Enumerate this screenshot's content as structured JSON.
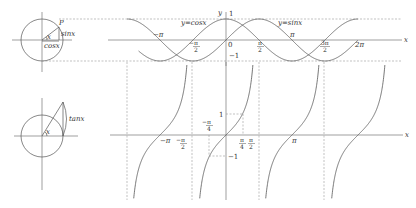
{
  "figure": {
    "title": "",
    "colors": {
      "background": "#ffffff",
      "curve": "#555555",
      "axis": "#777777",
      "dashed": "#999999",
      "text": "#333333"
    }
  },
  "unit_circle_sin": {
    "point_label": "P",
    "angle_label": "x",
    "sin_label": "sinx",
    "cos_label": "cosx"
  },
  "unit_circle_tan": {
    "angle_label": "x",
    "tan_label": "tanx"
  },
  "sin_cos_graph": {
    "axis_x_label": "x",
    "axis_y_label": "y",
    "cos_label": "y=cosx",
    "sin_label": "y=sinx",
    "tick_one": "1",
    "tick_neg_one": "−1",
    "origin": "0",
    "ticks": {
      "neg_pi": "−π",
      "neg_half_pi_num": "π",
      "neg_half_pi_den": "2",
      "half_pi_num": "π",
      "half_pi_den": "2",
      "pi": "π",
      "three_half_pi_num": "3π",
      "three_half_pi_den": "2",
      "two_pi": "2π"
    }
  },
  "tan_graph": {
    "axis_x_label": "x",
    "tick_one": "1",
    "tick_neg_one": "−1",
    "ticks": {
      "neg_pi": "−π",
      "neg_half_pi_num": "π",
      "neg_half_pi_den": "2",
      "neg_quarter_pi_num": "π",
      "neg_quarter_pi_den": "4",
      "quarter_pi_num": "π",
      "quarter_pi_den": "4",
      "half_pi_num": "π",
      "half_pi_den": "2",
      "pi": "π"
    }
  },
  "chart_data": [
    {
      "type": "line",
      "title": "y = sin x and y = cos x",
      "xlabel": "x",
      "ylabel": "y",
      "x_range": [
        -4.71,
        6.28
      ],
      "ylim": [
        -1,
        1
      ],
      "grid": false,
      "series": [
        {
          "name": "y=sinx",
          "function": "sin(x)"
        },
        {
          "name": "y=cosx",
          "function": "cos(x)"
        }
      ],
      "x_tick_labels": [
        "−π",
        "−π/2",
        "0",
        "π/2",
        "π",
        "3π/2",
        "2π"
      ],
      "y_tick_labels": [
        "1",
        "−1"
      ]
    },
    {
      "type": "line",
      "title": "y = tan x",
      "xlabel": "x",
      "x_range": [
        -4.71,
        4.71
      ],
      "asymptotes": [
        "−3π/2",
        "−π/2",
        "π/2",
        "3π/2"
      ],
      "series": [
        {
          "name": "y=tanx",
          "function": "tan(x)"
        }
      ],
      "x_tick_labels": [
        "−π",
        "−π/2",
        "−π/4",
        "π/4",
        "π/2",
        "π"
      ],
      "y_tick_labels": [
        "1",
        "−1"
      ],
      "marked_points": [
        {
          "x": "π/4",
          "y": 1
        },
        {
          "x": "−π/4",
          "y": -1
        }
      ]
    }
  ]
}
